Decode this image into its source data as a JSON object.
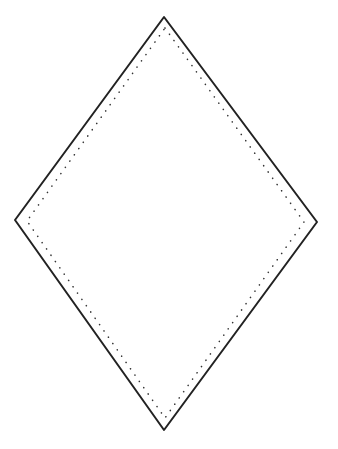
{
  "diagram": {
    "shape": "diamond",
    "background": "#ffffff",
    "outline": {
      "style": "solid",
      "color": "#222222",
      "stroke_width": 2,
      "points": [
        [
          164,
          17
        ],
        [
          317,
          222
        ],
        [
          164,
          430
        ],
        [
          15,
          220
        ]
      ]
    },
    "inner_outline": {
      "style": "dotted",
      "color": "#333333",
      "stroke_width": 1.6,
      "points": [
        [
          165,
          28
        ],
        [
          304,
          222
        ],
        [
          165,
          418
        ],
        [
          27,
          221
        ]
      ]
    }
  }
}
